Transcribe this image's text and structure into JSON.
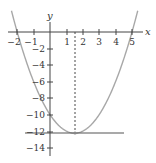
{
  "chart_data": {
    "type": "line",
    "title": "",
    "xlabel": "x",
    "ylabel": "y",
    "xlim": [
      -2.5,
      5.6
    ],
    "ylim": [
      -15,
      1.5
    ],
    "grid": false,
    "x_ticks": [
      -2,
      -1,
      1,
      2,
      3,
      4,
      5
    ],
    "y_ticks": [
      -2,
      -4,
      -6,
      -8,
      -10,
      -12,
      -14
    ],
    "series": [
      {
        "name": "parabola y = x^2 - 3x - 10",
        "style": "solid",
        "color": "#a8a8a8",
        "x": [
          -2.3,
          -2,
          -1,
          0,
          1,
          1.5,
          2,
          3,
          4,
          5,
          5.3
        ],
        "y": [
          -0.81,
          0,
          -6,
          -10,
          -12,
          -12.25,
          -12,
          -10,
          -6,
          0,
          1.39
        ]
      },
      {
        "name": "horizontal line y = -12.25",
        "style": "solid",
        "color": "#555555",
        "x": [
          -1.5,
          4.4
        ],
        "y": [
          -12.25,
          -12.25
        ]
      },
      {
        "name": "axis of symmetry x = 1.5",
        "style": "dashed",
        "color": "#333333",
        "x": [
          1.5,
          1.5
        ],
        "y": [
          0,
          -12.25
        ]
      }
    ],
    "annotations": [
      {
        "type": "point",
        "x": 1.5,
        "y": -12.25,
        "label": "vertex"
      }
    ]
  },
  "labels": {
    "x_axis": "x",
    "y_axis": "y",
    "x_ticks": [
      "−2",
      "−1",
      "1",
      "2",
      "3",
      "4",
      "5"
    ],
    "y_ticks": [
      "−2",
      "−4",
      "−6",
      "−8",
      "−10",
      "−12",
      "−14"
    ]
  }
}
